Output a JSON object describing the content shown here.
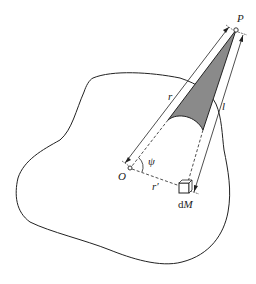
{
  "diagram": {
    "labels": {
      "P": "P",
      "O": "O",
      "r": "r",
      "l": "l",
      "psi": "ψ",
      "r_prime": "r′",
      "dM_d": "d",
      "dM_M": "M"
    },
    "colors": {
      "stroke": "#222222",
      "cone_fill": "#8a8a8a",
      "background": "#ffffff"
    }
  }
}
